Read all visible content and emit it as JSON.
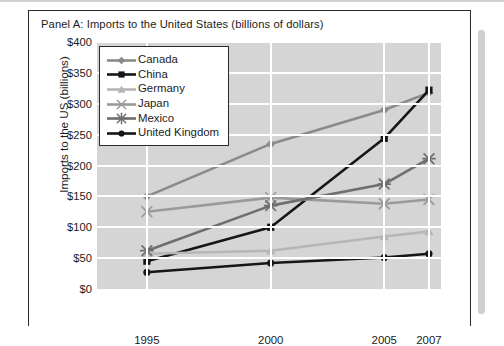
{
  "panel": {
    "title": "Panel A: Imports to the United States (billions of dollars)"
  },
  "chart_data": {
    "type": "line",
    "title": "Panel A: Imports to the United States (billions of dollars)",
    "xlabel": "",
    "ylabel": "Imports to the US (billions)",
    "categories": [
      "1995",
      "2000",
      "2005",
      "2007"
    ],
    "ylim": [
      0,
      400
    ],
    "ytick_values": [
      0,
      50,
      100,
      150,
      200,
      250,
      300,
      350,
      400
    ],
    "ytick_labels": [
      "$0",
      "$50",
      "$100",
      "$150",
      "$200",
      "$250",
      "$300",
      "$350",
      "$400"
    ],
    "grid": true,
    "legend_position": "top-left",
    "series": [
      {
        "name": "Canada",
        "marker": "diamond",
        "color": "#8a8a8a",
        "values": [
          150,
          235,
          290,
          318
        ]
      },
      {
        "name": "China",
        "marker": "square",
        "color": "#161616",
        "values": [
          45,
          100,
          244,
          322
        ]
      },
      {
        "name": "Germany",
        "marker": "triangle",
        "color": "#b6b6b6",
        "values": [
          57,
          62,
          85,
          93
        ]
      },
      {
        "name": "Japan",
        "marker": "x",
        "color": "#9a9a9a",
        "values": [
          125,
          148,
          138,
          145
        ]
      },
      {
        "name": "Mexico",
        "marker": "asterisk",
        "color": "#6e6e6e",
        "values": [
          62,
          135,
          170,
          211
        ]
      },
      {
        "name": "United Kingdom",
        "marker": "circle",
        "color": "#161616",
        "values": [
          27,
          42,
          51,
          57
        ]
      }
    ]
  }
}
